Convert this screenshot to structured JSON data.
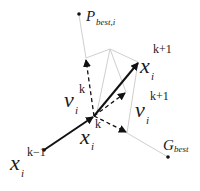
{
  "figure": {
    "colors": {
      "background": "#ffffff",
      "vector": "#111111",
      "guide": "#cfcfcf",
      "text": "#1a1a1a"
    }
  },
  "points": {
    "pbest": {
      "label": "P",
      "subscript": "best,i"
    },
    "gbest": {
      "label": "G",
      "subscript": "best"
    },
    "x_prev": {
      "label": "x",
      "subscript": "i",
      "superscript": "k−1"
    },
    "x_curr": {
      "label": "x",
      "subscript": "i",
      "superscript": "k"
    },
    "x_next": {
      "label": "x",
      "subscript": "i",
      "superscript": "k+1"
    }
  },
  "vectors": {
    "v_curr": {
      "label": "v",
      "subscript": "i",
      "superscript": "k"
    },
    "v_next": {
      "label": "v",
      "subscript": "i",
      "superscript": "k+1"
    }
  }
}
